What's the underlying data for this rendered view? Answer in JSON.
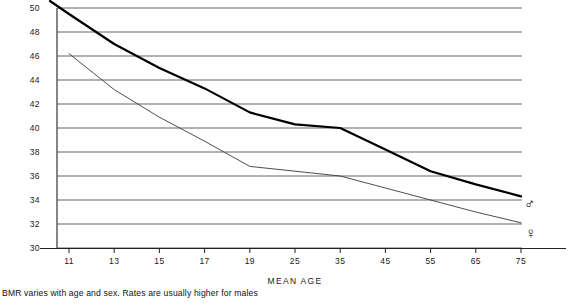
{
  "caption": "BMR varies with age and sex. Rates are usually higher for males",
  "axes": {
    "x_title": "MEAN AGE",
    "y_title": ""
  },
  "series_markers": {
    "male_symbol": "♂",
    "female_symbol": "♀",
    "male_icon_name": "male-symbol-icon",
    "female_icon_name": "female-symbol-icon"
  },
  "colors": {
    "male_line": "#000000",
    "female_line": "#3a3a3a",
    "grid": "#555555",
    "axis": "#222222",
    "background": "#ffffff"
  },
  "chart_data": {
    "type": "line",
    "title": "",
    "subtitle": "",
    "xlabel": "MEAN AGE",
    "ylabel": "",
    "annotation": "BMR varies with age and sex. Rates are usually higher for males",
    "grid": true,
    "legend_position": "inline-right-symbols",
    "x_tick_labels": [
      "11",
      "13",
      "15",
      "17",
      "19",
      "25",
      "35",
      "45",
      "55",
      "65",
      "75"
    ],
    "x_values": [
      11,
      13,
      15,
      17,
      19,
      25,
      35,
      45,
      55,
      65,
      75
    ],
    "y_tick_labels": [
      "30",
      "32",
      "34",
      "36",
      "38",
      "40",
      "42",
      "44",
      "46",
      "48",
      "50"
    ],
    "ylim": [
      30,
      50
    ],
    "y_tick_step": 2,
    "series": [
      {
        "name": "males",
        "symbol": "♂",
        "line_weight": "thick",
        "x": [
          11,
          13,
          15,
          17,
          19,
          25,
          35,
          45,
          55,
          65,
          75
        ],
        "values": [
          49.5,
          47.0,
          45.0,
          43.3,
          41.3,
          40.3,
          40.0,
          38.2,
          36.4,
          35.3,
          34.3
        ]
      },
      {
        "name": "females",
        "symbol": "♀",
        "line_weight": "thin",
        "x": [
          11,
          13,
          15,
          17,
          19,
          25,
          35,
          45,
          55,
          65,
          75
        ],
        "values": [
          46.2,
          43.2,
          40.9,
          38.9,
          36.8,
          36.4,
          36.0,
          35.0,
          34.0,
          33.0,
          32.1
        ]
      }
    ]
  }
}
